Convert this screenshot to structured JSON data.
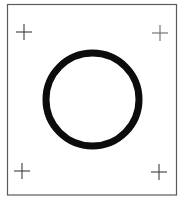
{
  "figure": {
    "width": 178,
    "height": 200,
    "background": "#ffffff",
    "frame": {
      "x": 7.5,
      "y": 4.5,
      "width": 169,
      "height": 190.5,
      "stroke": "#5a5a5a",
      "stroke_width": 1.2
    },
    "registration_marks": [
      {
        "position": "top-left",
        "cx": 24,
        "cy": 32,
        "arm": 8,
        "stroke": "#3c3c3c"
      },
      {
        "position": "top-right",
        "cx": 160,
        "cy": 33,
        "arm": 8,
        "stroke": "#6a6a6a"
      },
      {
        "position": "bottom-left",
        "cx": 22,
        "cy": 171,
        "arm": 8,
        "stroke": "#3c3c3c"
      },
      {
        "position": "bottom-right",
        "cx": 159,
        "cy": 172,
        "arm": 8,
        "stroke": "#3c3c3c"
      }
    ],
    "ring": {
      "cx": 92.5,
      "cy": 99.5,
      "r": 46.5,
      "stroke": "#0c0c0c",
      "stroke_width": 7
    }
  }
}
